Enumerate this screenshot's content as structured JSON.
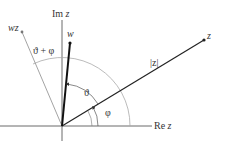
{
  "diagram": {
    "axes": {
      "real_label_prefix": "Re",
      "real_label_var": "z",
      "imag_label_prefix": "Im",
      "imag_label_var": "z"
    },
    "points": {
      "z": "z",
      "w": "w",
      "wz": "wz"
    },
    "labels": {
      "modulus": "|z|",
      "theta": "ϑ",
      "phi": "φ",
      "theta_plus_phi": "ϑ + φ"
    },
    "colors": {
      "axis": "#444444",
      "vector": "#222222",
      "arc": "#aaaaaa",
      "wz_line": "#999999"
    }
  }
}
